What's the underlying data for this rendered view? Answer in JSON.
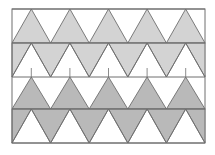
{
  "diagram": {
    "title": "",
    "frame": {
      "x0": 12,
      "x1": 205,
      "y0": 9,
      "y1": 143
    },
    "row_lines": [
      9,
      43,
      77,
      109,
      143
    ],
    "periods": 5,
    "colors": {
      "stroke": "#6e6e6e",
      "light_fill": "#d3d3d3",
      "dark_fill": "#b9b9b9",
      "background": "#ffffff"
    },
    "rows": [
      {
        "name": "row-1",
        "orientation": "up",
        "fill": "light",
        "top": 9,
        "bottom": 43
      },
      {
        "name": "row-2",
        "orientation": "down",
        "fill": "light",
        "top": 43,
        "bottom": 77
      },
      {
        "name": "row-3",
        "orientation": "up",
        "fill": "dark",
        "top": 77,
        "bottom": 109
      },
      {
        "name": "row-4",
        "orientation": "down",
        "fill": "dark",
        "top": 109,
        "bottom": 143
      }
    ],
    "ticks": {
      "from_y": 68,
      "to_y": 77
    }
  }
}
